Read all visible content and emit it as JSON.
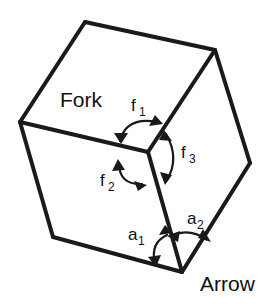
{
  "figure": {
    "background_color": "#ffffff",
    "stroke_color": "#1a1a1a",
    "width": 278,
    "height": 305
  },
  "labels": {
    "fork": {
      "text": "Fork",
      "x": 60,
      "y": 107
    },
    "arrow": {
      "text": "Arrow",
      "x": 200,
      "y": 291
    }
  },
  "angles": [
    {
      "id": "f1",
      "base": "f",
      "sub": "1",
      "x": 131,
      "y": 111,
      "sub_x": 142,
      "sub_y": 116
    },
    {
      "id": "f2",
      "base": "f",
      "sub": "2",
      "x": 100,
      "y": 186,
      "sub_x": 110,
      "sub_y": 191
    },
    {
      "id": "f3",
      "base": "f",
      "sub": "3",
      "x": 181,
      "y": 158,
      "sub_x": 191,
      "sub_y": 163
    },
    {
      "id": "a1",
      "base": "a",
      "sub": "1",
      "x": 128,
      "y": 240,
      "sub_x": 139,
      "sub_y": 245
    },
    {
      "id": "a2",
      "base": "a",
      "sub": "2",
      "x": 187,
      "y": 224,
      "sub_x": 198,
      "sub_y": 229
    }
  ],
  "geometry": {
    "vertices": {
      "top": [
        85,
        22
      ],
      "upper_right": [
        215,
        50
      ],
      "left": [
        20,
        122
      ],
      "right": [
        250,
        163
      ],
      "center": [
        148,
        152
      ],
      "bottom_left": [
        53,
        237
      ],
      "bottom": [
        182,
        272
      ]
    },
    "edges": [
      {
        "name": "top-to-upper-right",
        "path": "M 85 22 L 215 50"
      },
      {
        "name": "top-to-left",
        "path": "M 85 22 L 20 122"
      },
      {
        "name": "upper-right-to-right",
        "path": "M 215 50 L 250 163"
      },
      {
        "name": "upper-right-to-center",
        "path": "M 215 50 L 148 152"
      },
      {
        "name": "left-to-center",
        "path": "M 20 122 L 148 152"
      },
      {
        "name": "left-to-bottom-left",
        "path": "M 20 122 L 53 237"
      },
      {
        "name": "bottom-left-to-bottom",
        "path": "M 53 237 L 182 272"
      },
      {
        "name": "center-to-bottom",
        "path": "M 148 152 L 182 272"
      },
      {
        "name": "right-to-bottom",
        "path": "M 250 163 L 182 272"
      }
    ]
  }
}
